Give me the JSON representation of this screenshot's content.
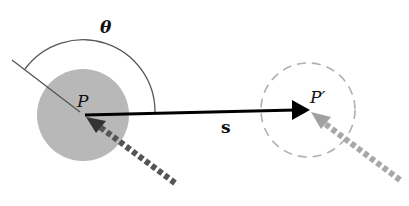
{
  "diagram": {
    "labels": {
      "angle": "θ",
      "point_start": "P",
      "point_end": "P′",
      "displacement": "s"
    },
    "colors": {
      "start_disk_fill": "#b8b8b8",
      "end_circle_stroke": "#b0b0b0",
      "displacement_arrow": "#000000",
      "incoming_arrow_start": "#555555",
      "incoming_arrow_end": "#a8a8a8",
      "angle_arc": "#555555",
      "reference_line": "#555555"
    },
    "elements": [
      {
        "id": "start-disk",
        "type": "filled-circle",
        "center": [
          83,
          115
        ],
        "radius": 46
      },
      {
        "id": "end-circle",
        "type": "dashed-circle",
        "center": [
          308,
          110
        ],
        "radius": 47
      },
      {
        "id": "displacement-vector",
        "type": "arrow",
        "from": [
          83,
          115
        ],
        "to": [
          305,
          110
        ],
        "label": "s"
      },
      {
        "id": "reference-line",
        "type": "line",
        "from": [
          12,
          60
        ],
        "to": [
          83,
          115
        ]
      },
      {
        "id": "angle-arc",
        "type": "arc",
        "label": "θ"
      },
      {
        "id": "incoming-arrow-start",
        "type": "dashed-arrow",
        "from": [
          175,
          183
        ],
        "to": [
          86,
          118
        ]
      },
      {
        "id": "incoming-arrow-end",
        "type": "dashed-arrow",
        "from": [
          400,
          180
        ],
        "to": [
          311,
          113
        ]
      }
    ]
  }
}
